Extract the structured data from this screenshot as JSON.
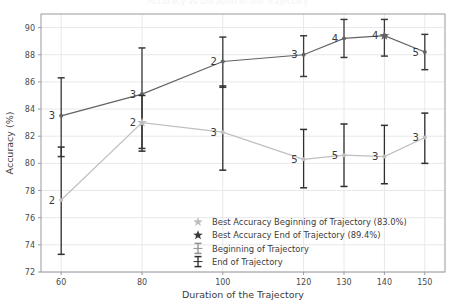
{
  "chart_data": {
    "type": "line",
    "title": "Accuracy vs Duration of the Trajectory",
    "xlabel": "Duration of the Trajectory",
    "ylabel": "Accuracy (%)",
    "grid": true,
    "legend_position": "lower right",
    "x": [
      60,
      80,
      100,
      120,
      130,
      140,
      150
    ],
    "xlim": [
      55,
      155
    ],
    "ylim": [
      72,
      91
    ],
    "xticks": [
      60,
      80,
      100,
      120,
      130,
      140,
      150
    ],
    "yticks": [
      72,
      74,
      76,
      78,
      80,
      82,
      84,
      86,
      88,
      90
    ],
    "colors": {
      "beginning": "#bfbfbf",
      "end": "#636363",
      "errorbar": "#2b2b2b",
      "grid": "#e8e8ec",
      "frame": "#9a9aa0"
    },
    "series": [
      {
        "name": "End of Trajectory",
        "key": "end",
        "values": [
          83.5,
          85.1,
          87.5,
          88.0,
          89.2,
          89.4,
          88.2
        ],
        "err_low": [
          80.5,
          81.1,
          85.6,
          86.4,
          87.8,
          87.9,
          86.9
        ],
        "err_high": [
          86.3,
          88.5,
          89.3,
          89.4,
          90.6,
          90.6,
          89.5
        ],
        "annotations": [
          "3",
          "3",
          "2",
          "3",
          "4",
          "4",
          "5"
        ],
        "best_index": 5,
        "best_value": 89.4
      },
      {
        "name": "Beginning of Trajectory",
        "key": "beginning",
        "values": [
          77.3,
          83.0,
          82.3,
          80.3,
          80.6,
          80.5,
          81.9
        ],
        "err_low": [
          73.3,
          80.9,
          79.5,
          78.2,
          78.3,
          78.5,
          80.0
        ],
        "err_high": [
          81.2,
          85.0,
          85.7,
          82.5,
          82.9,
          82.8,
          83.7
        ],
        "annotations": [
          "2",
          "2",
          "3",
          "5",
          "5",
          "3",
          "3"
        ],
        "best_index": 1,
        "best_value": 83.0
      }
    ],
    "legend": [
      {
        "label": "Best Accuracy Beginning of Trajectory (83.0%)",
        "marker": "star",
        "color": "#bfbfbf"
      },
      {
        "label": "Best Accuracy End of Trajectory (89.4%)",
        "marker": "star",
        "color": "#3a3a3a"
      },
      {
        "label": "Beginning of Trajectory",
        "marker": "errorbar",
        "color": "#bfbfbf"
      },
      {
        "label": "End of Trajectory",
        "marker": "errorbar",
        "color": "#3a3a3a"
      }
    ]
  }
}
